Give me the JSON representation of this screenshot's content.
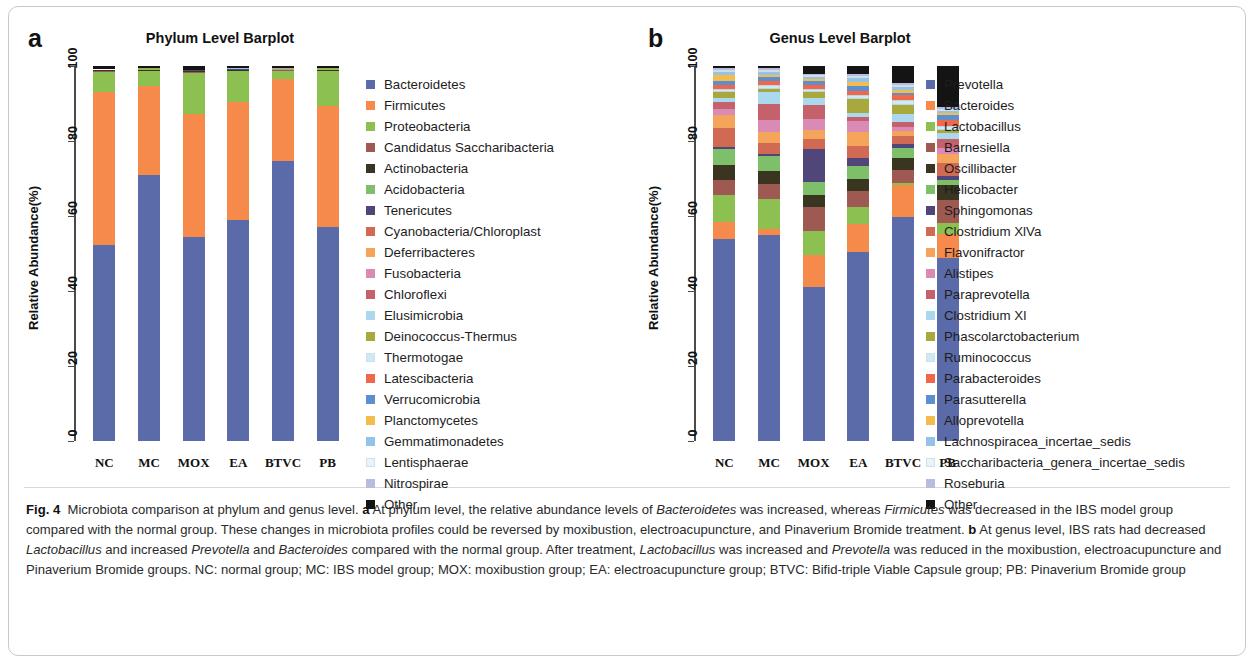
{
  "figure": {
    "panel_a_letter": "a",
    "panel_b_letter": "b",
    "title_a": "Phylum Level Barplot",
    "title_b": "Genus Level Barplot",
    "ylabel": "Relative Abundance(%)",
    "ytick_labels": [
      "0",
      "20",
      "40",
      "60",
      "80",
      "100"
    ],
    "group_labels": [
      "NC",
      "MC",
      "MOX",
      "EA",
      "BTVC",
      "PB"
    ],
    "caption_prefix": "Fig. 4",
    "caption": "Microbiota comparison at phylum and genus level. a At phylum level, the relative abundance levels of Bacteroidetes was increased, whereas Firmicutes was decreased in the IBS model group compared with the normal group. These changes in microbiota profiles could be reversed by moxibustion, electroacupuncture, and Pinaverium Bromide treatment. b At genus level, IBS rats had decreased Lactobacillus and increased Prevotella and Bacteroides compared with the normal group. After treatment, Lactobacillus was increased and Prevotella was reduced in the moxibustion, electroacupuncture and Pinaverium Bromide groups. NC: normal group; MC: IBS model group; MOX: moxibustion group; EA: electroacupuncture group; BTVC: Bifid-triple Viable Capsule group; PB: Pinaverium Bromide group"
  },
  "chart_data": [
    {
      "type": "bar",
      "subtype": "stacked-100-percent",
      "panel": "a",
      "title": "Phylum Level Barplot",
      "xlabel": "",
      "ylabel": "Relative Abundance(%)",
      "ylim": [
        0,
        100
      ],
      "yticks": [
        0,
        20,
        40,
        60,
        80,
        100
      ],
      "grid": false,
      "legend_position": "right",
      "categories": [
        "NC",
        "MC",
        "MOX",
        "EA",
        "BTVC",
        "PB"
      ],
      "series": [
        {
          "name": "Bacteroidetes",
          "color": "#5b6aa8",
          "values": [
            52.5,
            71.2,
            54.5,
            59.3,
            74.8,
            57.2
          ]
        },
        {
          "name": "Firmicutes",
          "color": "#f58a4b",
          "values": [
            40.8,
            23.6,
            32.8,
            31.5,
            22.0,
            32.6
          ]
        },
        {
          "name": "Proteobacteria",
          "color": "#8cc152",
          "values": [
            5.3,
            4.0,
            11.2,
            8.2,
            2.1,
            9.2
          ]
        },
        {
          "name": "Candidatus Saccharibacteria",
          "color": "#9e5a52",
          "values": [
            0.3,
            0.2,
            0.2,
            0.2,
            0.2,
            0.2
          ]
        },
        {
          "name": "Actinobacteria",
          "color": "#3a3520",
          "values": [
            0.2,
            0.2,
            0.2,
            0.2,
            0.2,
            0.2
          ]
        },
        {
          "name": "Acidobacteria",
          "color": "#7ec06a",
          "values": [
            0.1,
            0.1,
            0.1,
            0.1,
            0.1,
            0.1
          ]
        },
        {
          "name": "Tenericutes",
          "color": "#51467a",
          "values": [
            0.1,
            0.1,
            0.1,
            0.1,
            0.1,
            0.1
          ]
        },
        {
          "name": "Cyanobacteria/Chloroplast",
          "color": "#d06a52",
          "values": [
            0.05,
            0.05,
            0.05,
            0.05,
            0.05,
            0.05
          ]
        },
        {
          "name": "Deferribacteres",
          "color": "#f5a košile",
          "values": [
            0.05,
            0.05,
            0.05,
            0.05,
            0.05,
            0.05
          ]
        },
        {
          "name": "Fusobacteria",
          "color": "#d98ab5",
          "values": [
            0.02,
            0.02,
            0.02,
            0.02,
            0.02,
            0.02
          ]
        },
        {
          "name": "Chloroflexi",
          "color": "#c4616b",
          "values": [
            0.02,
            0.02,
            0.02,
            0.02,
            0.02,
            0.02
          ]
        },
        {
          "name": "Elusimicrobia",
          "color": "#a9d8ef",
          "values": [
            0.02,
            0.02,
            0.02,
            0.02,
            0.02,
            0.02
          ]
        },
        {
          "name": "Deinococcus-Thermus",
          "color": "#a8a83c",
          "values": [
            0.02,
            0.02,
            0.02,
            0.02,
            0.02,
            0.02
          ]
        },
        {
          "name": "Thermotogae",
          "color": "#cfeaf5",
          "values": [
            0.01,
            0.01,
            0.01,
            0.01,
            0.01,
            0.01
          ]
        },
        {
          "name": "Latescibacteria",
          "color": "#f0674a",
          "values": [
            0.01,
            0.01,
            0.01,
            0.01,
            0.01,
            0.01
          ]
        },
        {
          "name": "Verrucomicrobia",
          "color": "#5b8fd0",
          "values": [
            0.01,
            0.01,
            0.01,
            0.01,
            0.01,
            0.01
          ]
        },
        {
          "name": "Planctomycetes",
          "color": "#f4bc4d",
          "values": [
            0.01,
            0.01,
            0.01,
            0.01,
            0.01,
            0.01
          ]
        },
        {
          "name": "Gemmatimonadetes",
          "color": "#95c3e8",
          "values": [
            0.01,
            0.01,
            0.01,
            0.01,
            0.01,
            0.01
          ]
        },
        {
          "name": "Lentisphaerae",
          "color": "#e9f4f8",
          "values": [
            0.01,
            0.01,
            0.01,
            0.01,
            0.01,
            0.01
          ]
        },
        {
          "name": "Nitrospirae",
          "color": "#b8bde0",
          "values": [
            0.01,
            0.01,
            0.01,
            0.01,
            0.01,
            0.01
          ]
        },
        {
          "name": "Other",
          "color": "#141414",
          "values": [
            0.72,
            0.55,
            0.9,
            0.6,
            0.5,
            0.55
          ]
        }
      ]
    },
    {
      "type": "bar",
      "subtype": "stacked-100-percent",
      "panel": "b",
      "title": "Genus Level Barplot",
      "xlabel": "",
      "ylabel": "Relative Abundance(%)",
      "ylim": [
        0,
        100
      ],
      "yticks": [
        0,
        20,
        40,
        60,
        80,
        100
      ],
      "grid": false,
      "legend_position": "right",
      "categories": [
        "NC",
        "MC",
        "MOX",
        "EA",
        "BTVC",
        "PB"
      ],
      "series": [
        {
          "name": "Prevotella",
          "color": "#5b6aa8",
          "values": [
            54.0,
            55.0,
            41.0,
            48.5,
            66.0,
            49.0
          ]
        },
        {
          "name": "Bacteroides",
          "color": "#f58a4b",
          "values": [
            4.5,
            1.5,
            8.5,
            7.0,
            9.5,
            6.5
          ]
        },
        {
          "name": "Lactobacillus",
          "color": "#8cc152",
          "values": [
            7.0,
            8.0,
            6.5,
            4.5,
            0.5,
            3.0
          ]
        },
        {
          "name": "Barnesiella",
          "color": "#9e5a52",
          "values": [
            4.0,
            4.0,
            6.5,
            4.0,
            4.0,
            6.0
          ]
        },
        {
          "name": "Oscillibacter",
          "color": "#3a3520",
          "values": [
            4.0,
            3.5,
            3.0,
            3.0,
            3.5,
            4.0
          ]
        },
        {
          "name": "Helicobacter",
          "color": "#7ec06a",
          "values": [
            4.5,
            4.0,
            3.5,
            3.5,
            3.0,
            1.5
          ]
        },
        {
          "name": "Sphingomonas",
          "color": "#51467a",
          "values": [
            0.5,
            0.5,
            9.0,
            2.0,
            1.0,
            1.0
          ]
        },
        {
          "name": "Clostridium XlVa",
          "color": "#d06a52",
          "values": [
            5.0,
            3.0,
            2.5,
            3.0,
            2.5,
            3.5
          ]
        },
        {
          "name": "Flavonifractor",
          "color": "#f5a45b",
          "values": [
            3.5,
            3.0,
            2.5,
            3.5,
            1.5,
            2.5
          ]
        },
        {
          "name": "Alistipes",
          "color": "#d98ab5",
          "values": [
            1.5,
            3.0,
            3.0,
            3.0,
            1.0,
            1.5
          ]
        },
        {
          "name": "Paraprevotella",
          "color": "#c4616b",
          "values": [
            2.0,
            4.5,
            3.5,
            1.0,
            1.5,
            2.5
          ]
        },
        {
          "name": "Clostridium XI",
          "color": "#a9d8ef",
          "values": [
            1.0,
            3.0,
            2.0,
            1.0,
            2.5,
            1.5
          ]
        },
        {
          "name": "Phascolarctobacterium",
          "color": "#a8a83c",
          "values": [
            1.5,
            1.0,
            1.5,
            3.5,
            2.5,
            1.0
          ]
        },
        {
          "name": "Ruminococcus",
          "color": "#cfeaf5",
          "values": [
            1.0,
            1.0,
            1.0,
            1.0,
            1.5,
            1.0
          ]
        },
        {
          "name": "Parabacteroides",
          "color": "#f0674a",
          "values": [
            1.0,
            1.0,
            1.0,
            1.0,
            1.5,
            1.5
          ]
        },
        {
          "name": "Parasutterella",
          "color": "#5b8fd0",
          "values": [
            1.0,
            1.0,
            1.0,
            1.5,
            0.5,
            1.5
          ]
        },
        {
          "name": "Alloprevotella",
          "color": "#f4bc4d",
          "values": [
            1.5,
            0.5,
            0.5,
            1.0,
            1.0,
            0.5
          ]
        },
        {
          "name": "Lachnospiracea_incertae_sedis",
          "color": "#95c3e8",
          "values": [
            1.0,
            1.0,
            0.5,
            1.0,
            1.0,
            0.5
          ]
        },
        {
          "name": "Saccharibacteria_genera_incertae_sedis",
          "color": "#e9f4f8",
          "values": [
            0.5,
            0.5,
            0.5,
            0.5,
            0.5,
            0.5
          ]
        },
        {
          "name": "Roseburia",
          "color": "#b8bde0",
          "values": [
            0.5,
            0.5,
            0.5,
            0.5,
            0.5,
            0.5
          ]
        },
        {
          "name": "Other",
          "color": "#141414",
          "values": [
            0.5,
            0.5,
            2.0,
            2.0,
            5.0,
            11.0
          ]
        }
      ]
    }
  ],
  "legend_a": [
    {
      "label": "Bacteroidetes",
      "color": "#5b6aa8"
    },
    {
      "label": "Firmicutes",
      "color": "#f58a4b"
    },
    {
      "label": "Proteobacteria",
      "color": "#8cc152"
    },
    {
      "label": "Candidatus Saccharibacteria",
      "color": "#9e5a52"
    },
    {
      "label": "Actinobacteria",
      "color": "#3a3520"
    },
    {
      "label": "Acidobacteria",
      "color": "#7ec06a"
    },
    {
      "label": "Tenericutes",
      "color": "#51467a"
    },
    {
      "label": "Cyanobacteria/Chloroplast",
      "color": "#d06a52"
    },
    {
      "label": "Deferribacteres",
      "color": "#f5a45b"
    },
    {
      "label": "Fusobacteria",
      "color": "#d98ab5"
    },
    {
      "label": "Chloroflexi",
      "color": "#c4616b"
    },
    {
      "label": "Elusimicrobia",
      "color": "#a9d8ef"
    },
    {
      "label": "Deinococcus-Thermus",
      "color": "#a8a83c"
    },
    {
      "label": "Thermotogae",
      "color": "#cfeaf5"
    },
    {
      "label": "Latescibacteria",
      "color": "#f0674a"
    },
    {
      "label": "Verrucomicrobia",
      "color": "#5b8fd0"
    },
    {
      "label": "Planctomycetes",
      "color": "#f4bc4d"
    },
    {
      "label": "Gemmatimonadetes",
      "color": "#95c3e8"
    },
    {
      "label": "Lentisphaerae",
      "color": "#e9f4f8"
    },
    {
      "label": "Nitrospirae",
      "color": "#b8bde0"
    },
    {
      "label": "Other",
      "color": "#141414"
    }
  ],
  "legend_b": [
    {
      "label": "Prevotella",
      "color": "#5b6aa8"
    },
    {
      "label": "Bacteroides",
      "color": "#f58a4b"
    },
    {
      "label": "Lactobacillus",
      "color": "#8cc152"
    },
    {
      "label": "Barnesiella",
      "color": "#9e5a52"
    },
    {
      "label": "Oscillibacter",
      "color": "#3a3520"
    },
    {
      "label": "Helicobacter",
      "color": "#7ec06a"
    },
    {
      "label": "Sphingomonas",
      "color": "#51467a"
    },
    {
      "label": "Clostridium XlVa",
      "color": "#d06a52"
    },
    {
      "label": "Flavonifractor",
      "color": "#f5a45b"
    },
    {
      "label": "Alistipes",
      "color": "#d98ab5"
    },
    {
      "label": "Paraprevotella",
      "color": "#c4616b"
    },
    {
      "label": "Clostridium XI",
      "color": "#a9d8ef"
    },
    {
      "label": "Phascolarctobacterium",
      "color": "#a8a83c"
    },
    {
      "label": "Ruminococcus",
      "color": "#cfeaf5"
    },
    {
      "label": "Parabacteroides",
      "color": "#f0674a"
    },
    {
      "label": "Parasutterella",
      "color": "#5b8fd0"
    },
    {
      "label": "Alloprevotella",
      "color": "#f4bc4d"
    },
    {
      "label": "Lachnospiracea_incertae_sedis",
      "color": "#95c3e8"
    },
    {
      "label": "Saccharibacteria_genera_incertae_sedis",
      "color": "#e9f4f8"
    },
    {
      "label": "Roseburia",
      "color": "#b8bde0"
    },
    {
      "label": "Other",
      "color": "#141414"
    }
  ]
}
